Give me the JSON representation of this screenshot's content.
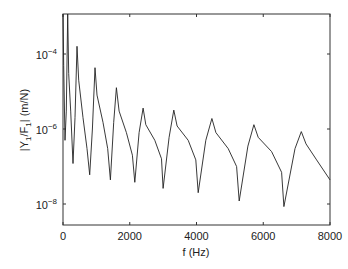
{
  "chart_data": {
    "type": "line",
    "title": "",
    "xlabel": "f (Hz)",
    "ylabel": "|Y1/F1| (m/N)",
    "xscale": "linear",
    "yscale": "log",
    "xlim": [
      0,
      8000
    ],
    "ylim": [
      2.7e-09,
      0.0012
    ],
    "grid": false,
    "legend": null,
    "x_ticks": [
      0,
      2000,
      4000,
      6000,
      8000
    ],
    "x_tick_labels": [
      "0",
      "2000",
      "4000",
      "6000",
      "8000"
    ],
    "y_ticks": [
      1e-08,
      1e-06,
      0.0001
    ],
    "y_tick_labels": [
      {
        "base": "10",
        "exp": "−8"
      },
      {
        "base": "10",
        "exp": "−6"
      },
      {
        "base": "10",
        "exp": "−4"
      }
    ],
    "series": [
      {
        "name": "|Y1/F1|",
        "color": "#222222",
        "points": [
          [
            0,
            0.0012
          ],
          [
            20,
            5e-05
          ],
          [
            60,
            5e-07
          ],
          [
            100,
            3e-06
          ],
          [
            140,
            0.0012
          ],
          [
            170,
            3e-05
          ],
          [
            230,
            3e-06
          ],
          [
            300,
            1.2e-07
          ],
          [
            360,
            2e-06
          ],
          [
            420,
            0.00016
          ],
          [
            470,
            2e-05
          ],
          [
            600,
            2e-06
          ],
          [
            720,
            3e-07
          ],
          [
            800,
            6e-08
          ],
          [
            880,
            1e-06
          ],
          [
            960,
            4.3e-05
          ],
          [
            1020,
            8e-06
          ],
          [
            1200,
            1.5e-06
          ],
          [
            1340,
            3e-07
          ],
          [
            1420,
            4.4e-08
          ],
          [
            1520,
            1.5e-06
          ],
          [
            1600,
            1.26e-05
          ],
          [
            1680,
            3e-06
          ],
          [
            1900,
            8e-07
          ],
          [
            2080,
            2e-07
          ],
          [
            2150,
            3.8e-08
          ],
          [
            2280,
            8e-07
          ],
          [
            2400,
            3.6e-06
          ],
          [
            2480,
            1.3e-06
          ],
          [
            2750,
            5e-07
          ],
          [
            2950,
            1.6e-07
          ],
          [
            3000,
            2.6e-08
          ],
          [
            3180,
            6e-07
          ],
          [
            3320,
            3.2e-06
          ],
          [
            3420,
            1.2e-06
          ],
          [
            3750,
            5e-07
          ],
          [
            3980,
            1.5e-07
          ],
          [
            4050,
            2e-08
          ],
          [
            4280,
            5e-07
          ],
          [
            4460,
            1.9e-06
          ],
          [
            4580,
            8e-07
          ],
          [
            4950,
            3e-07
          ],
          [
            5200,
            1e-07
          ],
          [
            5280,
            1.2e-08
          ],
          [
            5540,
            3.5e-07
          ],
          [
            5720,
            1.3e-06
          ],
          [
            5850,
            6e-07
          ],
          [
            6250,
            2.5e-07
          ],
          [
            6550,
            7e-08
          ],
          [
            6620,
            8.5e-09
          ],
          [
            6950,
            3e-07
          ],
          [
            7140,
            8.5e-07
          ],
          [
            7280,
            4e-07
          ],
          [
            7600,
            1.5e-07
          ],
          [
            8000,
            4.4e-08
          ]
        ]
      }
    ]
  }
}
